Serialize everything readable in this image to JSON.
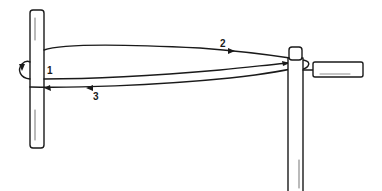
{
  "diagram": {
    "type": "line-drawing",
    "colors": {
      "stroke": "#1a1a1a",
      "background": "#ffffff"
    },
    "labels": [
      {
        "id": "1",
        "text": "1",
        "x": 47,
        "y": 66
      },
      {
        "id": "2",
        "text": "2",
        "x": 220,
        "y": 39
      },
      {
        "id": "3",
        "text": "3",
        "x": 93,
        "y": 92
      }
    ],
    "components": [
      {
        "name": "left-post"
      },
      {
        "name": "right-post"
      },
      {
        "name": "tension-handle"
      },
      {
        "name": "wire-loop"
      }
    ]
  }
}
